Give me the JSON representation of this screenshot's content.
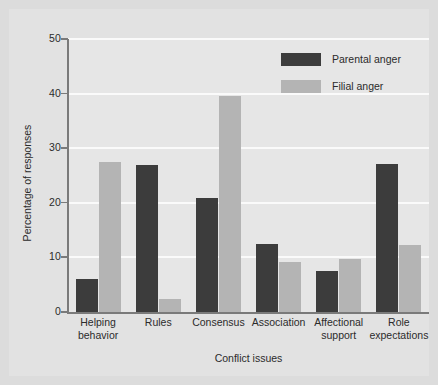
{
  "chart_data": {
    "type": "bar",
    "title": "",
    "xlabel": "Conflict issues",
    "ylabel": "Percentage of responses",
    "categories": [
      "Helping behavior",
      "Rules",
      "Consensus",
      "Association",
      "Affectional support",
      "Role expectations"
    ],
    "category_lines": [
      [
        "Helping",
        "behavior"
      ],
      [
        "Rules",
        ""
      ],
      [
        "Consensus",
        ""
      ],
      [
        "Association",
        ""
      ],
      [
        "Affectional",
        "support"
      ],
      [
        "Role",
        "expectations"
      ]
    ],
    "series": [
      {
        "name": "Parental anger",
        "color": "#3c3c3c",
        "values": [
          6.0,
          27.0,
          20.8,
          12.4,
          7.5,
          27.2
        ]
      },
      {
        "name": "Filial anger",
        "color": "#b4b4b4",
        "values": [
          27.5,
          2.4,
          39.5,
          9.2,
          9.8,
          12.2
        ]
      }
    ],
    "ylim": [
      0,
      50
    ],
    "yticks": [
      0,
      10,
      20,
      30,
      40,
      50
    ],
    "ytick_labels": [
      "0",
      "10",
      "20",
      "30",
      "40",
      "50"
    ],
    "grid": "horizontal-white",
    "legend_position": "top-right"
  },
  "colors": {
    "figure_background": "#dcdcdc",
    "card_background": "#e2e2e2",
    "panel_background": "#e6e6e6",
    "gridline": "#fafafa",
    "axis": "#7a7a7a",
    "text": "#2b2b2b"
  }
}
